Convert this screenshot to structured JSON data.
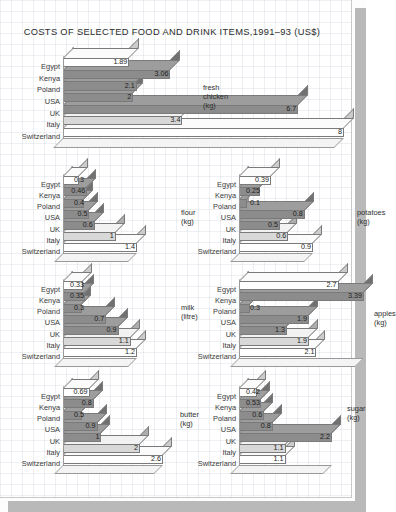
{
  "title": "COSTS OF SELECTED FOOD AND DRINK ITEMS,1991–93 (US$)",
  "categories": [
    "Egypt",
    "Kenya",
    "Poland",
    "USA",
    "UK",
    "Italy",
    "Switzerland"
  ],
  "colors": {
    "bar_white": "#ffffff",
    "bar_light": "#d8d8d8",
    "bar_mid": "#8c8c8c",
    "bar_outline": "#7a7a7a",
    "paper": "#ffffff",
    "frame_shadow": "#b9b9b9",
    "grid": "#96a5b9",
    "text": "#2b2b2b"
  },
  "chart_data": [
    {
      "type": "bar",
      "orientation": "horizontal",
      "title": "fresh chicken (kg)",
      "xlabel": "",
      "ylabel": "",
      "categories": [
        "Egypt",
        "Kenya",
        "Poland",
        "USA",
        "UK",
        "Italy",
        "Switzerland"
      ],
      "values": [
        1.89,
        3.06,
        2.1,
        2,
        6.7,
        3.4,
        8
      ],
      "labels": [
        "1.89",
        "3.06",
        "2.1",
        "2",
        "6.7",
        "3.4",
        "8"
      ],
      "xlim": [
        0,
        8
      ],
      "grid": true,
      "legend": "none"
    },
    {
      "type": "bar",
      "orientation": "horizontal",
      "title": "flour (kg)",
      "xlabel": "",
      "ylabel": "",
      "categories": [
        "Egypt",
        "Kenya",
        "Poland",
        "USA",
        "UK",
        "Italy",
        "Switzerland"
      ],
      "values": [
        0.3,
        0.46,
        0.4,
        0.5,
        0.6,
        1,
        1.4
      ],
      "labels": [
        "0.3",
        "0.46",
        "0.4",
        "0.5",
        "0.6",
        "1",
        "1.4"
      ],
      "xlim": [
        0,
        1.4
      ],
      "grid": true,
      "legend": "none"
    },
    {
      "type": "bar",
      "orientation": "horizontal",
      "title": "potatoes (kg)",
      "xlabel": "",
      "ylabel": "",
      "categories": [
        "Egypt",
        "Kenya",
        "Poland",
        "USA",
        "UK",
        "Italy",
        "Switzerland"
      ],
      "values": [
        0.39,
        0.25,
        0.1,
        0.8,
        0.5,
        0.6,
        0.9
      ],
      "labels": [
        "0.39",
        "0.25",
        "0.1",
        "0.8",
        "0.5",
        "0.6",
        "0.9"
      ],
      "xlim": [
        0,
        0.9
      ],
      "grid": true,
      "legend": "none"
    },
    {
      "type": "bar",
      "orientation": "horizontal",
      "title": "milk (litre)",
      "xlabel": "",
      "ylabel": "",
      "categories": [
        "Egypt",
        "Kenya",
        "Poland",
        "USA",
        "UK",
        "Italy",
        "Switzerland"
      ],
      "values": [
        0.33,
        0.35,
        0.3,
        0.7,
        0.9,
        1.1,
        1.2
      ],
      "labels": [
        "0.33",
        "0.35",
        "0.3",
        "0.7",
        "0.9",
        "1.1",
        "1.2"
      ],
      "xlim": [
        0,
        1.2
      ],
      "grid": true,
      "legend": "none"
    },
    {
      "type": "bar",
      "orientation": "horizontal",
      "title": "apples\n(kg)",
      "xlabel": "",
      "ylabel": "",
      "categories": [
        "Egypt",
        "Kenya",
        "Poland",
        "USA",
        "UK",
        "Italy",
        "Switzerland"
      ],
      "values": [
        2.7,
        3.39,
        0.3,
        1.9,
        1.3,
        1.9,
        2.1
      ],
      "labels": [
        "2.7",
        "3.39",
        "0.3",
        "1.9",
        "1.3",
        "1.9",
        "2.1"
      ],
      "xlim": [
        0,
        3.39
      ],
      "grid": true,
      "legend": "none"
    },
    {
      "type": "bar",
      "orientation": "horizontal",
      "title": "butter (kg)",
      "xlabel": "",
      "ylabel": "",
      "categories": [
        "Egypt",
        "Kenya",
        "Poland",
        "USA",
        "UK",
        "Italy",
        "Switzerland"
      ],
      "values": [
        0.69,
        0.8,
        0.5,
        0.9,
        1,
        2,
        2.6
      ],
      "labels": [
        "0.69",
        "0.8",
        "0.5",
        "0.9",
        "1",
        "2",
        "2.6"
      ],
      "xlim": [
        0,
        2.6
      ],
      "grid": true,
      "legend": "none"
    },
    {
      "type": "bar",
      "orientation": "horizontal",
      "title": "sugar (kg)",
      "xlabel": "",
      "ylabel": "",
      "categories": [
        "Egypt",
        "Kenya",
        "Poland",
        "USA",
        "UK",
        "Italy",
        "Switzerland"
      ],
      "values": [
        0.42,
        0.53,
        0.6,
        0.8,
        2.2,
        1.1,
        1.1
      ],
      "labels": [
        "0.42",
        "0.53",
        "0.6",
        "0.8",
        "2.2",
        "1.1",
        "1.1"
      ],
      "xlim": [
        0,
        2.2
      ],
      "grid": true,
      "legend": "none"
    }
  ],
  "layout": {
    "panels": [
      {
        "key": "chicken",
        "chart_index": 0,
        "left": 12,
        "top": 47,
        "label_w": 48,
        "plot_w": 281,
        "row_h": 11.6,
        "depth": 10,
        "name_x": 140,
        "name_y": 36
      },
      {
        "key": "flour",
        "chart_index": 1,
        "left": 12,
        "top": 166,
        "label_w": 48,
        "plot_w": 74,
        "row_h": 11.2,
        "depth": 9,
        "name_x": 118,
        "name_y": 42
      },
      {
        "key": "potatoes",
        "chart_index": 2,
        "left": 188,
        "top": 166,
        "label_w": 48,
        "plot_w": 74,
        "row_h": 11.2,
        "depth": 9,
        "name_x": 118,
        "name_y": 42
      },
      {
        "key": "milk",
        "chart_index": 3,
        "left": 12,
        "top": 271,
        "label_w": 48,
        "plot_w": 74,
        "row_h": 11.2,
        "depth": 9,
        "name_x": 118,
        "name_y": 32
      },
      {
        "key": "apples",
        "chart_index": 4,
        "left": 188,
        "top": 271,
        "label_w": 48,
        "plot_w": 125,
        "row_h": 11.2,
        "depth": 9,
        "name_x": 135,
        "name_y": 38
      },
      {
        "key": "butter",
        "chart_index": 5,
        "left": 12,
        "top": 378,
        "label_w": 48,
        "plot_w": 100,
        "row_h": 11.2,
        "depth": 9,
        "name_x": 117,
        "name_y": 32
      },
      {
        "key": "sugar",
        "chart_index": 6,
        "left": 188,
        "top": 378,
        "label_w": 48,
        "plot_w": 93,
        "row_h": 11.2,
        "depth": 9,
        "name_x": 108,
        "name_y": 26
      }
    ]
  }
}
